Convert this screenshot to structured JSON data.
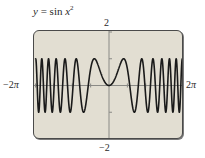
{
  "title": {
    "lhs": "y",
    "eq": " = ",
    "fn": "sin ",
    "var": "x",
    "exp": "2"
  },
  "labels": {
    "ymax": "2",
    "ymin": "−2",
    "xmin_num": "−2",
    "xmin_sym": "π",
    "xmax_num": "2",
    "xmax_sym": "π"
  },
  "colors": {
    "screen_bg": "#e2ded2",
    "curve": "#1a1a1a",
    "axis": "#8a8a86",
    "border": "#4a4a4a"
  },
  "chart_data": {
    "type": "line",
    "function": "sin(x^2)",
    "xlabel": "",
    "ylabel": "",
    "xlim": [
      -6.2832,
      6.2832
    ],
    "ylim": [
      -2,
      2
    ],
    "x_tick_labels": [
      "-2π",
      "2π"
    ],
    "y_tick_labels": [
      "2",
      "-2"
    ],
    "x_tick_step": 1.5708,
    "y_tick_step": 1,
    "grid": false,
    "legend": null,
    "series": [
      {
        "name": "y = sin x^2",
        "x": [
          -6.2832,
          -5.5,
          -4.7,
          -4.0,
          -3.3,
          -2.6,
          -2.2,
          -1.7725,
          -1.2533,
          -0.8,
          0,
          0.8,
          1.2533,
          1.7725,
          2.2,
          2.6,
          3.3,
          4.0,
          4.7,
          5.5,
          6.2832
        ],
        "y": [
          -0.9784,
          0.1929,
          0.9939,
          -0.2879,
          -0.9999,
          0.4833,
          -0.9886,
          0.0,
          1.0,
          0.5972,
          0.0,
          0.5972,
          1.0,
          0.0,
          -0.9886,
          0.4833,
          -0.9999,
          -0.2879,
          0.9939,
          0.1929,
          -0.9784
        ]
      }
    ],
    "annotations": []
  }
}
